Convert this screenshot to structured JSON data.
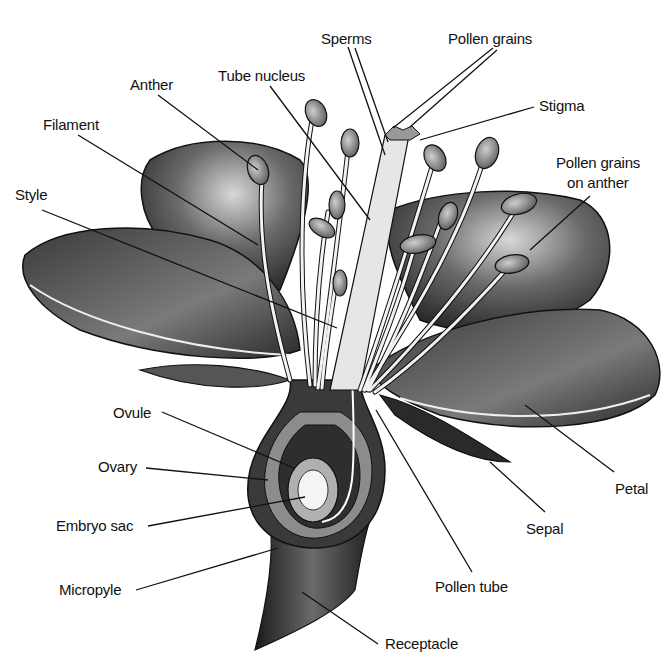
{
  "diagram": {
    "labels": {
      "sperms": "Sperms",
      "pollen_grains": "Pollen grains",
      "anther": "Anther",
      "tube_nucleus": "Tube nucleus",
      "stigma": "Stigma",
      "filament": "Filament",
      "pollen_grains_on_anther_1": "Pollen grains",
      "pollen_grains_on_anther_2": "on anther",
      "style": "Style",
      "ovule": "Ovule",
      "ovary": "Ovary",
      "embryo_sac": "Embryo sac",
      "micropyle": "Micropyle",
      "petal": "Petal",
      "sepal": "Sepal",
      "pollen_tube": "Pollen tube",
      "receptacle": "Receptacle"
    },
    "colors": {
      "ink": "#111111",
      "dark": "#2a2a2a",
      "mid": "#6e6e6e",
      "light": "#bdbdbd",
      "highlight": "#f2f2f2"
    }
  }
}
